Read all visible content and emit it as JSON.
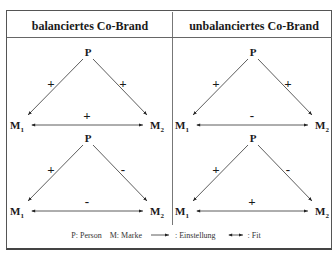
{
  "columns": [
    {
      "title": "balanciertes Co-Brand",
      "triangles": [
        {
          "top": "P",
          "left": "M",
          "left_sub": "1",
          "right": "M",
          "right_sub": "2",
          "sign_p_m1": "+",
          "sign_p_m2": "+",
          "sign_m1_m2": "+"
        },
        {
          "top": "P",
          "left": "M",
          "left_sub": "1",
          "right": "M",
          "right_sub": "2",
          "sign_p_m1": "+",
          "sign_p_m2": "-",
          "sign_m1_m2": "-"
        }
      ]
    },
    {
      "title": "unbalanciertes Co-Brand",
      "triangles": [
        {
          "top": "P",
          "left": "M",
          "left_sub": "1",
          "right": "M",
          "right_sub": "2",
          "sign_p_m1": "+",
          "sign_p_m2": "+",
          "sign_m1_m2": "-"
        },
        {
          "top": "P",
          "left": "M",
          "left_sub": "1",
          "right": "M",
          "right_sub": "2",
          "sign_p_m1": "+",
          "sign_p_m2": "-",
          "sign_m1_m2": "+"
        }
      ]
    }
  ],
  "legend": {
    "person": "P: Person",
    "marke": "M: Marke",
    "einstellung": ": Einstellung",
    "fit": ": Fit"
  }
}
